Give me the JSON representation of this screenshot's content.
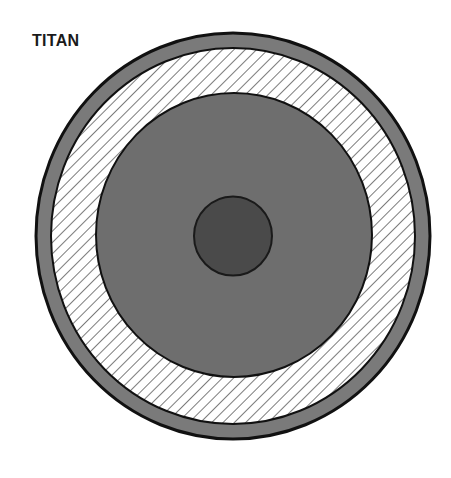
{
  "title": "TITAN",
  "diagram": {
    "type": "planetary-interior-cross-section",
    "layers": [
      {
        "name": "outer-crust",
        "fill": "#7a7a7a",
        "pattern": "solid"
      },
      {
        "name": "ice-shell",
        "fill": "#ffffff",
        "pattern": "diagonal-hatch"
      },
      {
        "name": "mantle",
        "fill": "#6e6e6e",
        "pattern": "solid"
      },
      {
        "name": "core",
        "fill": "#4a4a4a",
        "pattern": "solid"
      }
    ],
    "colors": {
      "outline": "#111111",
      "hatch": "#555555"
    }
  }
}
